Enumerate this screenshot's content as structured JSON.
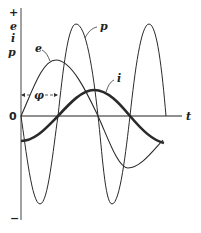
{
  "diagram": {
    "y_axis": {
      "top_sign": "+",
      "labels": [
        "e",
        "i",
        "p"
      ],
      "origin_label": "0",
      "bottom_sign": "−"
    },
    "x_axis": {
      "label": "t"
    },
    "curves": {
      "e": {
        "label": "e",
        "description": "voltage, sinusoid"
      },
      "i": {
        "label": "i",
        "description": "current, lagging by phi, thick line"
      },
      "p": {
        "label": "p",
        "description": "power, double frequency"
      }
    },
    "phase_label": "φ",
    "colors": {
      "line": "#2a2a2a",
      "axis": "#333333",
      "background": "#ffffff"
    }
  }
}
